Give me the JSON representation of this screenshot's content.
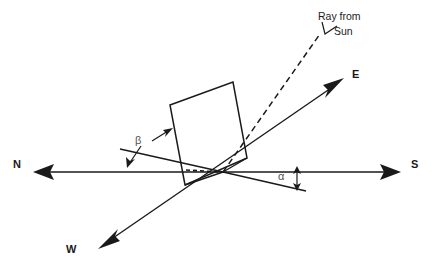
{
  "figure": {
    "background_color": "#ffffff",
    "stroke_color": "#1a1a1a",
    "greek_label_color": "#555555",
    "width": 433,
    "height": 280
  },
  "labels": {
    "north": "N",
    "south": "S",
    "east": "E",
    "west": "W",
    "beta": "β",
    "alpha": "α",
    "ray_line1": "Ray from",
    "ray_line2": "Sun"
  },
  "geometry": {
    "origin": {
      "x": 223,
      "y": 172
    },
    "ns_axis": {
      "name": "north-south-axis",
      "from": {
        "x": 398,
        "y": 172
      },
      "to": {
        "x": 35,
        "y": 172
      },
      "north_arrow_at": {
        "x": 35,
        "y": 172
      },
      "south_arrow_at": {
        "x": 398,
        "y": 172
      }
    },
    "ew_axis": {
      "name": "east-west-axis",
      "from": {
        "x": 100,
        "y": 247
      },
      "to": {
        "x": 342,
        "y": 80
      },
      "east_arrow_at": {
        "x": 342,
        "y": 80
      },
      "west_arrow_at": {
        "x": 100,
        "y": 247
      }
    },
    "sun_ray": {
      "name": "dashed-sun-ray",
      "from": {
        "x": 223,
        "y": 172
      },
      "to": {
        "x": 320,
        "y": 34
      },
      "style": "dashed"
    },
    "panel": {
      "name": "tilted-solar-panel",
      "corners": [
        {
          "x": 170,
          "y": 105
        },
        {
          "x": 233,
          "y": 82
        },
        {
          "x": 247,
          "y": 158
        },
        {
          "x": 185,
          "y": 185
        }
      ]
    },
    "panel_base_projection": {
      "name": "panel-base-dotted-projection",
      "from": {
        "x": 185,
        "y": 170
      },
      "to": {
        "x": 223,
        "y": 172
      },
      "style": "dotted"
    },
    "tilt_reference_line": {
      "name": "beta-tilt-reference-line",
      "from": {
        "x": 120,
        "y": 148
      },
      "to": {
        "x": 223,
        "y": 172
      }
    },
    "alpha_reference_line": {
      "name": "alpha-azimuth-reference-line",
      "from": {
        "x": 223,
        "y": 172
      },
      "to": {
        "x": 305,
        "y": 190
      }
    },
    "alpha_double_arrow": {
      "name": "alpha-height-double-arrow",
      "x": 297,
      "top_y": 168,
      "bottom_y": 188
    },
    "beta_pointer_down": {
      "name": "beta-pointer-to-tilt-line",
      "from": {
        "x": 140,
        "y": 144
      },
      "to": {
        "x": 128,
        "y": 165
      }
    },
    "beta_pointer_up": {
      "name": "beta-pointer-to-panel",
      "from": {
        "x": 152,
        "y": 140
      },
      "to": {
        "x": 172,
        "y": 128
      }
    },
    "ray_leader": {
      "name": "ray-from-sun-leader",
      "from": {
        "x": 333,
        "y": 27
      },
      "to": {
        "x": 320,
        "y": 34
      }
    }
  }
}
